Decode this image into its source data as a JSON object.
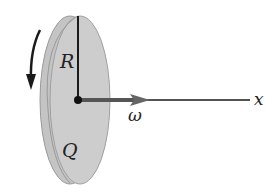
{
  "diagram": {
    "labels": {
      "radius": "R",
      "charge": "Q",
      "angular_velocity": "ω",
      "axis": "x"
    },
    "colors": {
      "disk_fill": "#c8c8c8",
      "disk_edge": "#8a8a8a",
      "line": "#1a1a1a",
      "omega_vector": "#555555"
    }
  }
}
